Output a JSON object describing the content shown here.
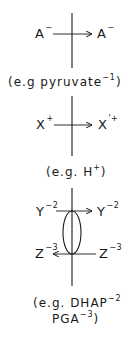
{
  "diagram": {
    "type": "membrane transport schematic",
    "stroke_color": "#1a1a1a",
    "panels": [
      {
        "id": "uniport",
        "left_species": "A",
        "left_charge": "−",
        "right_species": "A",
        "right_charge": "−",
        "arrow_direction": "left-to-right",
        "example_prefix": "(e.g ",
        "example_species": "pyruvate",
        "example_charge": "−1",
        "example_suffix": ")"
      },
      {
        "id": "proton",
        "left_species": "X",
        "left_charge": "+",
        "right_species": "X",
        "right_charge": "'+",
        "arrow_direction": "left-to-right",
        "example_prefix": "(e.g. ",
        "example_species": "H",
        "example_charge": "+",
        "example_suffix": ")"
      },
      {
        "id": "antiport",
        "carrier": "ellipse",
        "top_left_species": "Y",
        "top_left_charge": "−2",
        "top_right_species": "Y",
        "top_right_charge": "−2",
        "top_arrow_direction": "left-to-right",
        "bottom_left_species": "Z",
        "bottom_left_charge": "−3",
        "bottom_right_species": "Z",
        "bottom_right_charge": "−3",
        "bottom_arrow_direction": "right-to-left",
        "example_line1_prefix": "(e.g. ",
        "example_line1_species": "DHAP",
        "example_line1_charge": "−2",
        "example_line2_species": "PGA",
        "example_line2_charge": "−3",
        "example_line2_suffix": ")"
      }
    ]
  }
}
